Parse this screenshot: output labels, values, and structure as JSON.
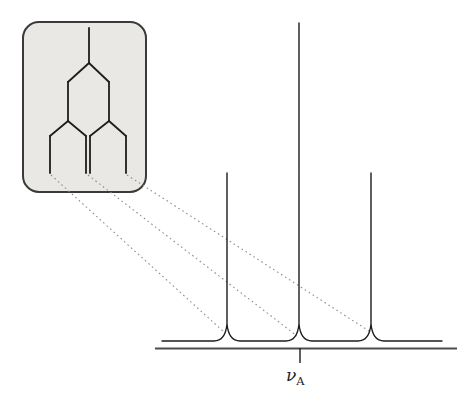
{
  "colors": {
    "background": "#ffffff",
    "line": "#1d1d1d",
    "axis": "#4d4d4d",
    "connector": "#8e8e8e",
    "inset_fill": "#e9e8e4",
    "inset_stroke": "#3a3a3a"
  },
  "label": {
    "symbol": "ν",
    "subscript": "A"
  },
  "drawing": {
    "canvas": {
      "width": 473,
      "height": 408
    },
    "inset_box": {
      "x": 23,
      "y": 22,
      "width": 123,
      "height": 170,
      "radius": 16,
      "stroke_width": 2
    },
    "tree": {
      "stroke_width": 1.8,
      "segments": [
        [
          89,
          28,
          89,
          63
        ],
        [
          89,
          63,
          68,
          82
        ],
        [
          89,
          63,
          109,
          82
        ],
        [
          68,
          82,
          68,
          121
        ],
        [
          109,
          82,
          109,
          121
        ],
        [
          68,
          121,
          50,
          136
        ],
        [
          68,
          121,
          86,
          136
        ],
        [
          109,
          121,
          90,
          136
        ],
        [
          109,
          121,
          126,
          136
        ],
        [
          50,
          136,
          50,
          173
        ],
        [
          86,
          136,
          86,
          173
        ],
        [
          90,
          136,
          90,
          173
        ],
        [
          126,
          136,
          126,
          173
        ]
      ]
    },
    "connectors": {
      "stroke_width": 1.1,
      "dash": "1.6 3.1",
      "lines": [
        [
          51,
          175,
          224,
          332
        ],
        [
          88,
          175,
          297,
          336
        ],
        [
          127,
          175,
          369,
          331
        ]
      ]
    },
    "spectrum": {
      "stroke_width": 1.4,
      "baseline_y": 341,
      "curve_x1": 162,
      "curve_x2": 442,
      "flare_half_width": 13,
      "flare_rise": 17,
      "peaks": [
        {
          "x": 227,
          "top": 173
        },
        {
          "x": 299,
          "top": 23
        },
        {
          "x": 371,
          "top": 173
        }
      ]
    },
    "axis": {
      "x1": 155,
      "x2": 457,
      "y": 348.5,
      "stroke_width": 2
    },
    "tick": {
      "x": 300,
      "y1": 348,
      "y2": 363,
      "stroke_width": 1.4
    }
  },
  "chart_data": {
    "type": "line",
    "title": "",
    "xlabel": "νA",
    "ylabel": "",
    "series": [
      {
        "name": "triplet peaks",
        "points": [
          {
            "position": "left of νA",
            "relative_intensity": 1
          },
          {
            "position": "νA (centre)",
            "relative_intensity": 2
          },
          {
            "position": "right of νA",
            "relative_intensity": 1
          }
        ]
      }
    ],
    "x_tick_labels": [
      "νA"
    ],
    "grid": false,
    "legend": false
  }
}
